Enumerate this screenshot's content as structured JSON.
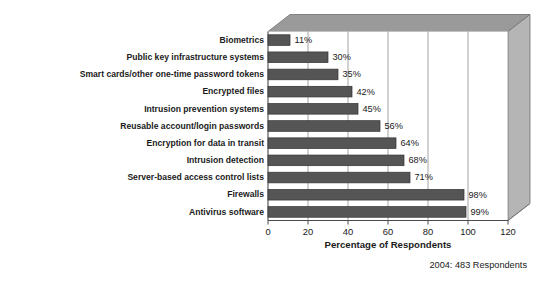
{
  "chart_data": {
    "type": "bar",
    "orientation": "horizontal",
    "title": "",
    "xlabel": "Percentage of Respondents",
    "ylabel": "",
    "xlim": [
      0,
      120
    ],
    "xticks": [
      0,
      20,
      40,
      60,
      80,
      100,
      120
    ],
    "xtick_labels": [
      "0",
      "20",
      "40",
      "60",
      "80",
      "100",
      "120"
    ],
    "grid": true,
    "grid_axis": "x",
    "legend": false,
    "categories": [
      "Biometrics",
      "Public key infrastructure systems",
      "Smart cards/other one-time password tokens",
      "Encrypted files",
      "Intrusion prevention systems",
      "Reusable account/login passwords",
      "Encryption for data in transit",
      "Intrusion detection",
      "Server-based access control lists",
      "Firewalls",
      "Antivirus software"
    ],
    "values": [
      11,
      30,
      35,
      42,
      45,
      56,
      64,
      68,
      71,
      98,
      99
    ],
    "value_labels": [
      "11%",
      "30%",
      "35%",
      "42%",
      "45%",
      "56%",
      "64%",
      "68%",
      "71%",
      "98%",
      "99%"
    ],
    "footnote": "2004: 483 Respondents",
    "colors": {
      "bar_fill": "#555555",
      "bar_stroke": "#333333",
      "plot_background": "#ffffff",
      "panel_top_face": "#9a9a9a",
      "panel_side_face": "#b5b5b5",
      "grid_line": "#9a9a9a",
      "axis_line": "#4a4a4a",
      "text": "#1b1b1b"
    }
  }
}
